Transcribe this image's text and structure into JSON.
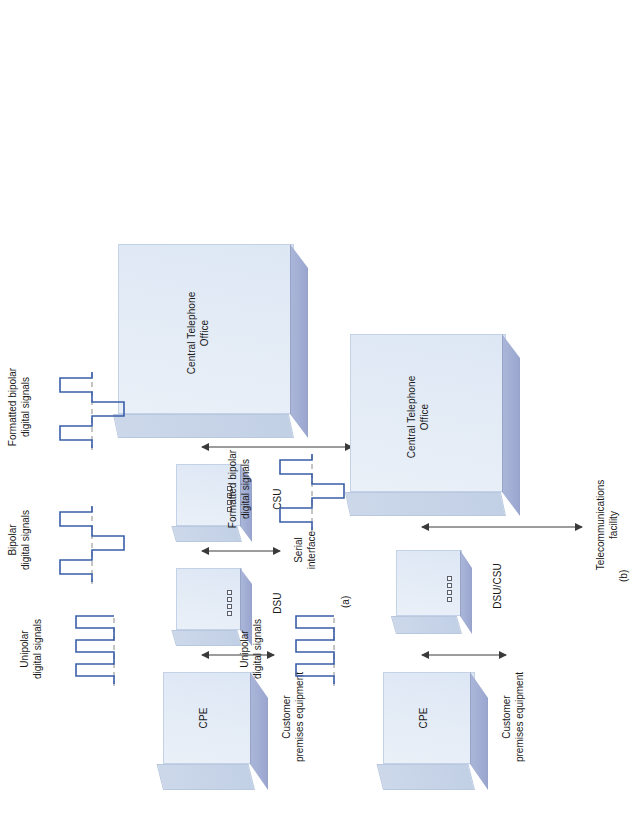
{
  "figure": {
    "colors": {
      "box_front": "#e4ecf6",
      "box_side": "#c6d3e8",
      "box_top": "#a2aed3",
      "waveform_line": "#3a5ea8",
      "dashed_axis": "#8a8a8a",
      "arrow": "#3a3a3a",
      "text": "#1a1a1a",
      "background": "#ffffff"
    }
  },
  "panels": [
    {
      "id": "a",
      "caption": "(a)",
      "nodes": [
        {
          "key": "cpe",
          "label": "CPE",
          "sublabel": "Customer\npremises equipment",
          "sub_line1": "Customer",
          "sub_line2": "premises equipment",
          "type": "cube"
        },
        {
          "key": "dsu",
          "label": "DSU",
          "sublabel": "",
          "type": "slab",
          "leds": 4
        },
        {
          "key": "csu",
          "label": "CSU",
          "sublabel": "",
          "type": "slab",
          "leds": 4
        },
        {
          "key": "cto",
          "label": "Central Telephone\nOffice",
          "label_line1": "Central Telephone",
          "label_line2": "Office",
          "sublabel": "",
          "type": "tall"
        }
      ],
      "links": [
        {
          "key": "cpe-dsu",
          "label": "",
          "label_line1": "",
          "label_line2": "",
          "arrow": "both"
        },
        {
          "key": "dsu-csu",
          "label": "Serial interface",
          "label_line1": "Serial",
          "label_line2": "interface",
          "arrow": "both"
        },
        {
          "key": "csu-cto",
          "label": "Telecommunications facility",
          "label_line1": "Telecommunications",
          "label_line2": "facility",
          "arrow": "both"
        }
      ],
      "waveforms": [
        {
          "key": "unipolar",
          "label_line1": "Unipolar",
          "label_line2": "digital signals",
          "type": "unipolar"
        },
        {
          "key": "bipolar",
          "label_line1": "Bipolar",
          "label_line2": "digital signals",
          "type": "bipolar"
        },
        {
          "key": "formatted",
          "label_line1": "Formatted bipolar",
          "label_line2": "digital signals",
          "type": "bipolar"
        }
      ]
    },
    {
      "id": "b",
      "caption": "(b)",
      "nodes": [
        {
          "key": "cpe",
          "label": "CPE",
          "sub_line1": "Customer",
          "sub_line2": "premises equipment",
          "type": "cube"
        },
        {
          "key": "dsucsu",
          "label": "DSU/CSU",
          "sub_line1": "",
          "sub_line2": "",
          "type": "slab",
          "leds": 4
        },
        {
          "key": "cto",
          "label_line1": "Central Telephone",
          "label_line2": "Office",
          "type": "tall"
        }
      ],
      "links": [
        {
          "key": "cpe-dsucsu",
          "label_line1": "",
          "label_line2": "",
          "arrow": "both"
        },
        {
          "key": "dsucsu-cto",
          "label_line1": "Telecommunications",
          "label_line2": "facility",
          "arrow": "both"
        }
      ],
      "waveforms": [
        {
          "key": "unipolar",
          "label_line1": "Unipolar",
          "label_line2": "digital signals",
          "type": "unipolar"
        },
        {
          "key": "formatted",
          "label_line1": "Formatted bipolar",
          "label_line2": "digital signals",
          "type": "bipolar"
        }
      ]
    }
  ]
}
